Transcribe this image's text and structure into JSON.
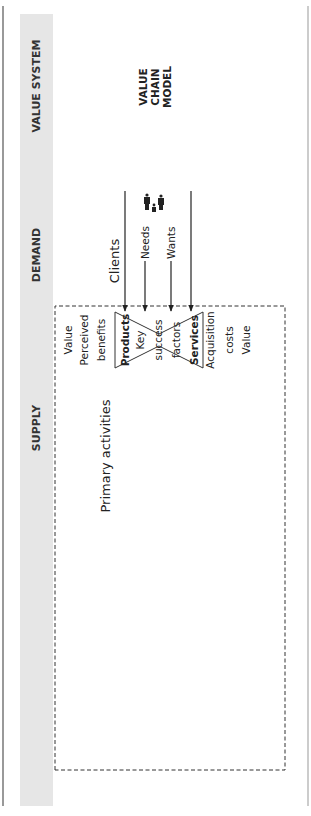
{
  "header": {
    "bands": [
      {
        "id": "supply",
        "label": "SUPPLY"
      },
      {
        "id": "demand",
        "label": "DEMAND"
      },
      {
        "id": "value_system",
        "label": "VALUE SYSTEM"
      }
    ],
    "title_lines": [
      "VALUE",
      "CHAIN",
      "MODEL"
    ]
  },
  "demand": {
    "clients_label": "Clients",
    "needs_label": "Needs",
    "wants_label": "Wants",
    "people_icon": "family-people-icon"
  },
  "hourglass": {
    "products_label": "Products",
    "key_label": "Key",
    "success_label": "success",
    "factors_label": "factors",
    "services_label": "Services"
  },
  "value_side": {
    "left": [
      "Value",
      "Perceived",
      "benefits"
    ],
    "right": [
      "Acquisition",
      "costs",
      "Value"
    ]
  },
  "primary": {
    "title": "Primary activities",
    "lines": [
      "Product line",
      "Service line"
    ],
    "stages": [
      "Input logistics",
      "Process",
      "Outbound logistics"
    ],
    "plus_value": "+ value"
  },
  "support": {
    "title": "Support activities",
    "activities": [
      "Procurement",
      "HR",
      "IT",
      "R&D",
      "Sales & marketing",
      "Client service"
    ]
  },
  "colors": {
    "band": "#e6e6e6",
    "line": "#222222",
    "border": "#555555"
  }
}
